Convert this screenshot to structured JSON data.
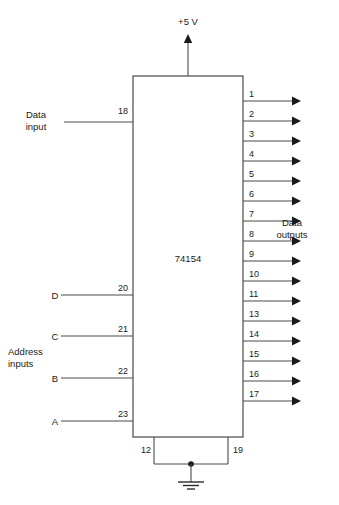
{
  "diagram": {
    "chip": {
      "part_number": "74154",
      "box": {
        "x": 133,
        "y": 76,
        "width": 110,
        "height": 361
      }
    },
    "power": {
      "label": "+5 V",
      "pin_x": 188,
      "label_x": 188,
      "label_y": 25,
      "arrow_top_y": 34
    },
    "ground": {
      "pins": [
        {
          "number": "12",
          "x": 154,
          "label_x": 141,
          "label_y": 453
        },
        {
          "number": "19",
          "x": 228,
          "label_x": 233,
          "label_y": 453
        }
      ],
      "bus_y": 464,
      "symbol_x": 191,
      "symbol_top_y": 464
    },
    "data_input": {
      "label_line1": "Data",
      "label_line2": "input",
      "label_x": 36,
      "label_y": 118,
      "pin": "18",
      "pin_label_x": 128,
      "pin_label_y": 114,
      "wire_y": 122,
      "wire_x_start": 64
    },
    "address_inputs": {
      "group_label_line1": "Address",
      "group_label_line2": "inputs",
      "group_label_x": 8,
      "group_label_y": 355,
      "wire_x_start": 61,
      "signals": [
        {
          "name": "D",
          "pin": "20",
          "wire_y": 295,
          "name_x": 55,
          "pin_label_x": 128
        },
        {
          "name": "C",
          "pin": "21",
          "wire_y": 336,
          "name_x": 55,
          "pin_label_x": 128
        },
        {
          "name": "B",
          "pin": "22",
          "wire_y": 378,
          "name_x": 55,
          "pin_label_x": 128
        },
        {
          "name": "A",
          "pin": "23",
          "wire_y": 421,
          "name_x": 55,
          "pin_label_x": 128
        }
      ]
    },
    "data_outputs": {
      "group_label_line1": "Data",
      "group_label_line2": "outputs",
      "group_label_x": 292,
      "group_label_y": 226,
      "wire_x_end": 301,
      "pin_label_x": 249,
      "pins": [
        {
          "number": "1",
          "wire_y": 101
        },
        {
          "number": "2",
          "wire_y": 121
        },
        {
          "number": "3",
          "wire_y": 141
        },
        {
          "number": "4",
          "wire_y": 161
        },
        {
          "number": "5",
          "wire_y": 181
        },
        {
          "number": "6",
          "wire_y": 201
        },
        {
          "number": "7",
          "wire_y": 221
        },
        {
          "number": "8",
          "wire_y": 241
        },
        {
          "number": "9",
          "wire_y": 261
        },
        {
          "number": "10",
          "wire_y": 281
        },
        {
          "number": "11",
          "wire_y": 301
        },
        {
          "number": "13",
          "wire_y": 321
        },
        {
          "number": "14",
          "wire_y": 341
        },
        {
          "number": "15",
          "wire_y": 361
        },
        {
          "number": "16",
          "wire_y": 381
        },
        {
          "number": "17",
          "wire_y": 401
        }
      ]
    },
    "colors": {
      "background": "#ffffff",
      "wire": "#4a4a4a",
      "text": "#1a1a1a"
    }
  }
}
